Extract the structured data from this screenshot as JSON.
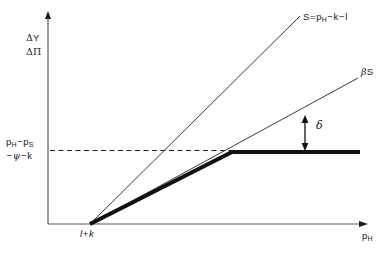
{
  "figure": {
    "type": "line-diagram",
    "background": "#ffffff",
    "ink_color": "#1a1a1a",
    "axes": {
      "y_axis": {
        "name": "vertical-axis",
        "label_line1": "ΔY",
        "label_line2": "ΔΠ",
        "has_arrowhead": true,
        "x_px": 48,
        "y_top_px": 13,
        "y_bottom_px": 224
      },
      "x_axis": {
        "name": "horizontal-axis",
        "label": "p_H",
        "label_base": "p",
        "label_sub": "H",
        "has_arrowhead": true,
        "y_px": 224,
        "x_left_px": 48,
        "x_right_px": 366
      },
      "x_tick": {
        "label": "l + k",
        "x_px": 90
      },
      "y_tick": {
        "label_line1": "p_H − p_S",
        "line1_parts": [
          "p",
          "H",
          "−",
          "p",
          "S"
        ],
        "label_line2": "−ψ − k",
        "y_px": 150
      }
    },
    "curves": [
      {
        "name": "s-line",
        "label": "S = p_H − k − l",
        "label_parts": [
          "S",
          "=",
          "p",
          "H",
          "−",
          "k",
          "−",
          "l"
        ],
        "style": "thin-solid",
        "stroke_width": 1,
        "points": [
          [
            90,
            224
          ],
          [
            300,
            16
          ]
        ]
      },
      {
        "name": "beta-s-line",
        "label": "βS",
        "style": "thin-solid",
        "stroke_width": 1,
        "points": [
          [
            90,
            224
          ],
          [
            358,
            78
          ]
        ]
      },
      {
        "name": "payoff-kinked-line",
        "label": "",
        "style": "thick-solid",
        "stroke_width": 4,
        "points": [
          [
            90,
            224
          ],
          [
            232,
            152
          ],
          [
            360,
            152
          ]
        ]
      },
      {
        "name": "threshold-dashed-line",
        "label": "",
        "style": "dashed",
        "stroke_width": 1,
        "points": [
          [
            50,
            150
          ],
          [
            232,
            150
          ]
        ]
      }
    ],
    "annotations": [
      {
        "name": "delta-gap-arrow",
        "label": "δ",
        "arrow": "double-headed-vertical",
        "x_px": 305,
        "y_top_px": 118,
        "y_bottom_px": 149
      }
    ],
    "caption": ""
  }
}
